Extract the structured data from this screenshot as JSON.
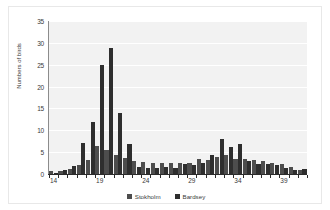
{
  "chart_data": {
    "type": "bar",
    "title": "",
    "xlabel": "",
    "ylabel": "Numbers of birds",
    "ylim": [
      0,
      35
    ],
    "ytick_values": [
      0,
      5,
      10,
      15,
      20,
      25,
      30,
      35
    ],
    "ytick_labels": [
      "0",
      "5",
      "10",
      "15",
      "20",
      "25",
      "30",
      "35"
    ],
    "grid": true,
    "legend_position": "bottom",
    "categories": [
      14,
      15,
      16,
      17,
      18,
      19,
      20,
      21,
      22,
      23,
      24,
      25,
      26,
      27,
      28,
      29,
      30,
      31,
      32,
      33,
      34,
      35,
      36,
      37,
      38,
      39,
      40,
      41
    ],
    "xtick_labels": [
      "14",
      "19",
      "24",
      "29",
      "34",
      "39"
    ],
    "xtick_categories": [
      14,
      19,
      24,
      29,
      34,
      39
    ],
    "series": [
      {
        "name": "Stokholm",
        "color": "#4d4d4d",
        "values": [
          0.8,
          0.6,
          1.2,
          2.0,
          3.2,
          6.5,
          5.5,
          4.3,
          3.6,
          3.0,
          2.7,
          2.5,
          2.6,
          2.5,
          2.6,
          2.5,
          3.5,
          3.2,
          4.0,
          4.3,
          3.4,
          3.5,
          3.2,
          2.9,
          2.5,
          2.3,
          1.7,
          1.0
        ]
      },
      {
        "name": "Bardsey",
        "color": "#2e2e2e",
        "values": [
          0.2,
          1.0,
          1.9,
          7.0,
          12.0,
          24.9,
          28.8,
          13.9,
          6.8,
          1.5,
          1.4,
          1.3,
          1.5,
          1.4,
          2.2,
          2.1,
          2.5,
          4.4,
          8.0,
          6.2,
          6.9,
          3.0,
          2.4,
          2.2,
          2.0,
          1.4,
          0.9,
          1.2
        ]
      }
    ]
  },
  "legend": {
    "items": [
      {
        "label": "Stokholm"
      },
      {
        "label": "Bardsey"
      }
    ]
  }
}
